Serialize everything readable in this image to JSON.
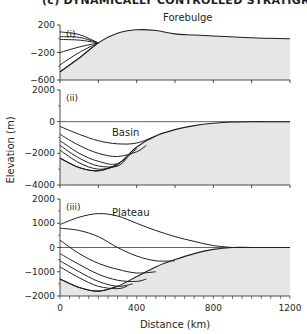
{
  "figure": {
    "title": "(c) DYNAMICALLY CONTROLLED STRATIGRAPHY",
    "ylabel": "Elevation (m)",
    "xlabel": "Distance (km)"
  },
  "chart_data": [
    {
      "type": "line",
      "panel": "(i)",
      "title": "Forebulge",
      "xlabel": "Distance (km)",
      "ylabel": "Elevation (m)",
      "xlim": [
        0,
        1200
      ],
      "ylim": [
        -600,
        200
      ],
      "yticks": [
        200,
        -200,
        -600
      ],
      "xticks": [
        0,
        200,
        400,
        600,
        800,
        1000,
        1200
      ],
      "grid": false,
      "fill": "basement shaded grey below lowest surface",
      "basement": {
        "x": [
          0,
          100,
          200,
          300,
          400,
          500,
          600,
          700,
          800,
          1000,
          1200
        ],
        "y": [
          -480,
          -280,
          -60,
          80,
          130,
          120,
          70,
          55,
          40,
          15,
          0
        ]
      },
      "series": [
        {
          "name": "surface 1",
          "x": [
            0,
            100,
            200
          ],
          "y": [
            100,
            60,
            -60
          ]
        },
        {
          "name": "surface 2",
          "x": [
            0,
            100,
            200
          ],
          "y": [
            30,
            20,
            -60
          ]
        },
        {
          "name": "surface 3",
          "x": [
            0,
            100,
            200
          ],
          "y": [
            -10,
            -20,
            -60
          ]
        },
        {
          "name": "surface 4",
          "x": [
            0,
            100,
            200
          ],
          "y": [
            -200,
            -120,
            -60
          ]
        },
        {
          "name": "surface 5",
          "x": [
            0,
            100,
            200
          ],
          "y": [
            -380,
            -200,
            -60
          ]
        },
        {
          "name": "surface 6",
          "x": [
            0,
            100,
            200
          ],
          "y": [
            -480,
            -280,
            -60
          ]
        }
      ]
    },
    {
      "type": "line",
      "panel": "(ii)",
      "title": "Basin",
      "xlabel": "Distance (km)",
      "ylabel": "Elevation (m)",
      "xlim": [
        0,
        1200
      ],
      "ylim": [
        -4000,
        2000
      ],
      "yticks": [
        2000,
        0,
        -2000,
        -4000
      ],
      "xticks": [
        0,
        200,
        400,
        600,
        800,
        1000,
        1200
      ],
      "sea_level": 0,
      "grid": false,
      "basement": {
        "x": [
          0,
          100,
          200,
          300,
          400,
          500,
          600,
          700,
          800,
          900,
          1000,
          1100,
          1200
        ],
        "y": [
          -2300,
          -2900,
          -3100,
          -2700,
          -1600,
          -900,
          -500,
          -250,
          -100,
          -20,
          0,
          0,
          0
        ]
      },
      "series": [
        {
          "name": "surface 1",
          "x": [
            0,
            100,
            200,
            300,
            400,
            500
          ],
          "y": [
            -300,
            -800,
            -1200,
            -1400,
            -1350,
            -900
          ]
        },
        {
          "name": "surface 2",
          "x": [
            0,
            100,
            200,
            300,
            400,
            450
          ],
          "y": [
            -800,
            -1500,
            -2000,
            -2200,
            -1900,
            -1500
          ]
        },
        {
          "name": "surface 3",
          "x": [
            0,
            100,
            200,
            300,
            400
          ],
          "y": [
            -1200,
            -2000,
            -2500,
            -2650,
            -1700
          ]
        },
        {
          "name": "surface 4",
          "x": [
            0,
            100,
            200,
            300,
            350
          ],
          "y": [
            -1500,
            -2300,
            -2800,
            -2800,
            -2300
          ]
        },
        {
          "name": "surface 5",
          "x": [
            0,
            100,
            200,
            300
          ],
          "y": [
            -1800,
            -2600,
            -3000,
            -2800
          ]
        },
        {
          "name": "surface 6",
          "x": [
            0,
            100,
            200,
            300
          ],
          "y": [
            -2300,
            -2900,
            -3100,
            -2700
          ]
        }
      ]
    },
    {
      "type": "line",
      "panel": "(iii)",
      "title": "Plateau",
      "xlabel": "Distance (km)",
      "ylabel": "Elevation (m)",
      "xlim": [
        0,
        1200
      ],
      "ylim": [
        -2000,
        2000
      ],
      "yticks": [
        2000,
        1000,
        0,
        -1000,
        -2000
      ],
      "xticks": [
        0,
        400,
        800,
        1200
      ],
      "xtick_minor_step": 50,
      "sea_level": 0,
      "grid": false,
      "basement": {
        "x": [
          0,
          100,
          200,
          300,
          400,
          500,
          600,
          700,
          800,
          900,
          1000,
          1200
        ],
        "y": [
          -1300,
          -1650,
          -1800,
          -1600,
          -1200,
          -800,
          -500,
          -250,
          -80,
          0,
          0,
          0
        ]
      },
      "series": [
        {
          "name": "surface 1",
          "x": [
            0,
            100,
            200,
            300,
            400,
            500,
            600,
            700,
            800,
            900
          ],
          "y": [
            950,
            1250,
            1400,
            1300,
            1000,
            700,
            450,
            250,
            80,
            0
          ]
        },
        {
          "name": "surface 2",
          "x": [
            0,
            100,
            200,
            300,
            400,
            500,
            600
          ],
          "y": [
            800,
            700,
            450,
            0,
            -350,
            -550,
            -550
          ]
        },
        {
          "name": "surface 3",
          "x": [
            0,
            100,
            200,
            300,
            400,
            500
          ],
          "y": [
            300,
            -250,
            -650,
            -900,
            -1050,
            -1000
          ]
        },
        {
          "name": "surface 4",
          "x": [
            0,
            100,
            200,
            300,
            400,
            450
          ],
          "y": [
            -250,
            -700,
            -1100,
            -1350,
            -1400,
            -1300
          ]
        },
        {
          "name": "surface 5",
          "x": [
            0,
            100,
            200,
            300,
            380
          ],
          "y": [
            -550,
            -1000,
            -1400,
            -1600,
            -1500
          ]
        },
        {
          "name": "surface 6",
          "x": [
            0,
            100,
            200,
            300,
            350
          ],
          "y": [
            -800,
            -1250,
            -1600,
            -1700,
            -1600
          ]
        },
        {
          "name": "surface 7",
          "x": [
            0,
            100,
            200,
            300
          ],
          "y": [
            -1300,
            -1650,
            -1800,
            -1600
          ]
        }
      ]
    }
  ],
  "colors": {
    "line": "#231f20",
    "fill": "#e6e6e6",
    "axis": "#231f20"
  }
}
